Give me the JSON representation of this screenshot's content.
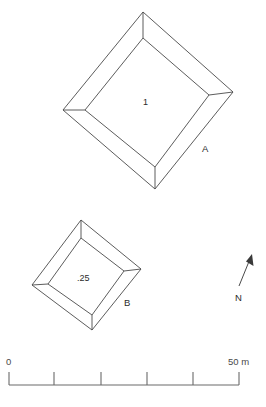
{
  "figure": {
    "type": "archaeological-site-plan",
    "background_color": "#ffffff",
    "line_color": "#4a4a4a"
  },
  "mounds": [
    {
      "id": "mound-a",
      "label": "A",
      "height_label": "1",
      "height_units": "relative height",
      "label_position": {
        "x": 202,
        "y": 144
      },
      "height_label_position": {
        "x": 143,
        "y": 98
      },
      "outer": {
        "top": [
          143,
          12
        ],
        "right": [
          233,
          92
        ],
        "bottom": [
          155,
          189
        ],
        "left": [
          63,
          110
        ]
      },
      "inner": {
        "top": [
          143,
          38
        ],
        "right": [
          209,
          95
        ],
        "bottom": [
          155,
          167
        ],
        "left": [
          85,
          110
        ]
      }
    },
    {
      "id": "mound-b",
      "label": "B",
      "height_label": ".25",
      "height_units": "relative height",
      "label_position": {
        "x": 124,
        "y": 298
      },
      "height_label_position": {
        "x": 77,
        "y": 274
      },
      "outer": {
        "top": [
          81,
          220
        ],
        "right": [
          141,
          269
        ],
        "bottom": [
          92,
          330
        ],
        "left": [
          32,
          285
        ]
      },
      "inner": {
        "top": [
          81,
          238
        ],
        "right": [
          124,
          271
        ],
        "bottom": [
          92,
          315
        ],
        "left": [
          48,
          284
        ]
      }
    }
  ],
  "north_arrow": {
    "label": "N",
    "label_position": {
      "x": 235,
      "y": 293
    },
    "tail": [
      239,
      286
    ],
    "tip": [
      252,
      255
    ]
  },
  "scale_bar": {
    "start_label": "0",
    "end_label": "50 m",
    "start_label_position": {
      "x": 6,
      "y": 357
    },
    "end_label_position": {
      "x": 228,
      "y": 357
    },
    "baseline_y": 385,
    "x_start": 9,
    "x_end": 239,
    "tick_top_y": 372,
    "tick_positions": [
      9,
      54,
      101,
      147,
      193,
      239
    ],
    "interval_count": 5,
    "interval_value_m": 10,
    "total_value_m": 50,
    "units": "m"
  }
}
